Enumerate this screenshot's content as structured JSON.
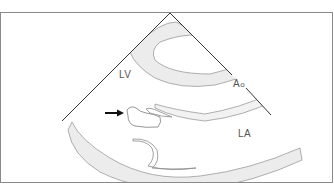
{
  "diagram": {
    "type": "echocardiogram schematic (parasternal long-axis view)",
    "labels": {
      "lv": "LV",
      "ao_main": "A",
      "ao_sub": "o",
      "la": "LA"
    },
    "annotations": {
      "arrow": "arrow pointing right at mass near aortic/mitral region"
    },
    "colors": {
      "frame": "#8a8a8a",
      "sector_line": "#333333",
      "tissue_fill": "#ececec",
      "tissue_stroke": "#9a9a9a",
      "arrow": "#111111",
      "label": "#555555"
    }
  }
}
